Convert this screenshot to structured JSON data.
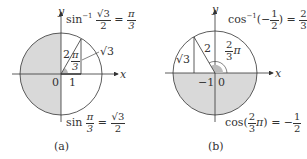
{
  "panels": [
    {
      "id": "a",
      "caption": "(a)",
      "axis_x": "x",
      "axis_y": "y",
      "origin_label": "0",
      "tick_label": "1",
      "hyp_label": "2",
      "side_label": "√3",
      "angle_label": {
        "num": "π",
        "den": "3"
      },
      "top_eq": {
        "func": "sin",
        "sup": "−1",
        "num": "√3",
        "den": "2",
        "eq": "=",
        "rnum": "π",
        "rden": "3"
      },
      "bottom_eq": {
        "func": "sin",
        "num": "π",
        "den": "3",
        "eq": "=",
        "rnum": "√3",
        "rden": "2"
      },
      "shaded": "left half",
      "colors": {
        "shade": "#d9d9d9",
        "line": "#333333"
      }
    },
    {
      "id": "b",
      "caption": "(b)",
      "axis_x": "x",
      "axis_y": "y",
      "origin_label": "0",
      "tick_label": "−1",
      "hyp_label": "2",
      "side_label": "√3",
      "angle_label": {
        "num": "2",
        "den": "3",
        "suffix": "π"
      },
      "top_eq": {
        "func": "cos",
        "sup": "−1",
        "arg": "(−1/2)",
        "argnum": "1",
        "argden": "2",
        "eq": "=",
        "rnum": "2",
        "rden": "3",
        "rsuffix": "π"
      },
      "bottom_eq": {
        "func": "cos",
        "argnum": "2",
        "argden": "3",
        "argsuffix": "π",
        "eq": "=",
        "rnum": "1",
        "rden": "2",
        "rprefix": "−"
      },
      "shaded": "bottom half",
      "colors": {
        "shade": "#d9d9d9",
        "line": "#333333"
      }
    }
  ]
}
